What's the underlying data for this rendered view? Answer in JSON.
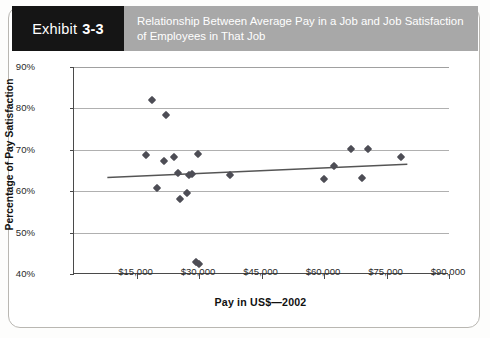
{
  "exhibit": {
    "word": "Exhibit",
    "number": "3-3",
    "tab_bg": "#151515",
    "band_bg": "#a8a8a8"
  },
  "header": {
    "title": "Relationship Between Average Pay in a Job and Job Satisfaction of Employees in That Job"
  },
  "chart_data": {
    "type": "scatter",
    "title": "Relationship Between Average Pay in a Job and Job Satisfaction of Employees in That Job",
    "xlabel": "Pay in US$—2002",
    "ylabel": "Percentage of Pay Satisfaction",
    "xlim": [
      0,
      90000
    ],
    "ylim": [
      40,
      90
    ],
    "xticks": [
      15000,
      30000,
      45000,
      60000,
      75000,
      90000
    ],
    "xtick_labels": [
      "$15,000",
      "$30,000",
      "$45,000",
      "$60,000",
      "$75,000",
      "$90,000"
    ],
    "yticks": [
      40,
      50,
      60,
      70,
      80,
      90
    ],
    "ytick_labels": [
      "40%",
      "50%",
      "60%",
      "70%",
      "80%",
      "90%"
    ],
    "grid": "horizontal",
    "legend": "none",
    "marker": "diamond",
    "marker_color": "#4d4d55",
    "points": [
      {
        "x": 18700,
        "y": 82.0
      },
      {
        "x": 22000,
        "y": 78.5
      },
      {
        "x": 17200,
        "y": 68.7
      },
      {
        "x": 21500,
        "y": 67.2
      },
      {
        "x": 24000,
        "y": 68.3
      },
      {
        "x": 29800,
        "y": 68.9
      },
      {
        "x": 25000,
        "y": 64.3
      },
      {
        "x": 27500,
        "y": 64.0
      },
      {
        "x": 28400,
        "y": 64.1
      },
      {
        "x": 20000,
        "y": 60.7
      },
      {
        "x": 25500,
        "y": 58.2
      },
      {
        "x": 27100,
        "y": 59.5
      },
      {
        "x": 37500,
        "y": 64.0
      },
      {
        "x": 60000,
        "y": 63.0
      },
      {
        "x": 62500,
        "y": 66.0
      },
      {
        "x": 66500,
        "y": 70.3
      },
      {
        "x": 69000,
        "y": 63.2
      },
      {
        "x": 70500,
        "y": 70.3
      },
      {
        "x": 78500,
        "y": 68.2
      },
      {
        "x": 29200,
        "y": 43.0
      },
      {
        "x": 29900,
        "y": 42.3
      }
    ],
    "trendline": {
      "x_start": 8000,
      "y_start": 63.3,
      "x_end": 80000,
      "y_end": 66.5,
      "color": "#555555"
    }
  }
}
